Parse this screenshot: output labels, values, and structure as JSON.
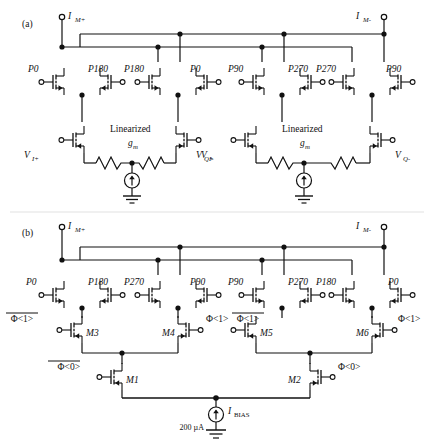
{
  "figure": {
    "panels": [
      {
        "tag": "(a)",
        "name": "panel-a"
      },
      {
        "tag": "(b)",
        "name": "panel-b"
      }
    ]
  },
  "panel_a": {
    "tag": "(a)",
    "terminals": {
      "left": "I",
      "left_sub": "M+",
      "right": "I",
      "right_sub": "M-"
    },
    "pmos_labels": [
      "P0",
      "P180",
      "P180",
      "P0",
      "P90",
      "P270",
      "P270",
      "P90"
    ],
    "gm_blocks": [
      {
        "title_line1": "Linearized",
        "title_line2": "g",
        "title_sub": "m",
        "input_left": "V",
        "input_left_sub": "I+",
        "input_right": "V",
        "input_right_sub": "I-"
      },
      {
        "title_line1": "Linearized",
        "title_line2": "g",
        "title_sub": "m",
        "input_left": "V",
        "input_left_sub": "Q+",
        "input_right": "V",
        "input_right_sub": "Q-"
      }
    ]
  },
  "panel_b": {
    "tag": "(b)",
    "terminals": {
      "left": "I",
      "left_sub": "M+",
      "right": "I",
      "right_sub": "M-"
    },
    "pmos_labels": [
      "P0",
      "P180",
      "P270",
      "P90",
      "P90",
      "P270",
      "P180",
      "P0"
    ],
    "switch_transistors": [
      {
        "name": "M3",
        "gate": "Φ<1>",
        "overline": true,
        "side": "left"
      },
      {
        "name": "M4",
        "gate": "Φ<1>",
        "overline": false,
        "side": "right"
      },
      {
        "name": "M5",
        "gate": "Φ<1>",
        "overline": true,
        "side": "left"
      },
      {
        "name": "M6",
        "gate": "Φ<1>",
        "overline": false,
        "side": "right"
      }
    ],
    "tail_transistors": [
      {
        "name": "M1",
        "gate": "Φ<0>",
        "overline": true
      },
      {
        "name": "M2",
        "gate": "Φ<0>",
        "overline": false
      }
    ],
    "bias": {
      "symbol": "I",
      "symbol_sub": "BIAS",
      "value": "200 µA"
    }
  },
  "colors": {
    "wire": "#111111",
    "background": "#ffffff"
  }
}
